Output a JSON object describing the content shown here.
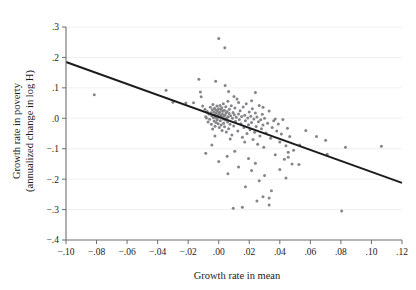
{
  "chart_data": {
    "type": "scatter",
    "title": "",
    "xlabel": "Growth rate in mean",
    "ylabel": "Growth rate in poverty\n(annualized change in log H)",
    "ylabel_line1": "Growth rate in poverty",
    "ylabel_line2": "(annualized change in log H)",
    "xlim": [
      -0.1,
      0.12
    ],
    "ylim": [
      -0.4,
      0.3
    ],
    "xticks": [
      -0.1,
      -0.08,
      -0.06,
      -0.04,
      -0.02,
      0.0,
      0.02,
      0.04,
      0.06,
      0.08,
      0.1,
      0.12
    ],
    "xticklabels": [
      "−.10",
      "−.08",
      "−.06",
      "−.04",
      "−.02",
      ".00",
      ".02",
      ".04",
      ".06",
      ".08",
      ".10",
      ".12"
    ],
    "yticks": [
      0.3,
      0.2,
      0.1,
      0.0,
      -0.1,
      -0.2,
      -0.3,
      -0.4
    ],
    "yticklabels": [
      ".3",
      ".2",
      ".1",
      ".0",
      "−.1",
      "−.2",
      "−.3",
      "−.4"
    ],
    "grid": "horizontal",
    "legend": "none",
    "marker_color": "#858589",
    "line_color": "#1c1c1c",
    "grid_color": "#e8e8ea",
    "axis_color": "#6d6d70",
    "fit_line": {
      "label": "linear fit",
      "x_start": -0.1,
      "y_start": 0.185,
      "x_end": 0.12,
      "y_end": -0.212,
      "slope": -1.805,
      "intercept": 0.0045
    },
    "points": [
      [
        -0.0815,
        0.077
      ],
      [
        -0.0345,
        0.092
      ],
      [
        -0.03,
        0.053
      ],
      [
        -0.0215,
        0.05
      ],
      [
        -0.0165,
        0.051
      ],
      [
        -0.013,
        0.128
      ],
      [
        -0.012,
        0.086
      ],
      [
        -0.0115,
        0.071
      ],
      [
        -0.0105,
        0.04
      ],
      [
        -0.009,
        0.03
      ],
      [
        -0.0085,
        0.005
      ],
      [
        -0.008,
        0.001
      ],
      [
        -0.0075,
        0.022
      ],
      [
        -0.007,
        -0.012
      ],
      [
        -0.0065,
        0.014
      ],
      [
        -0.006,
        -0.003
      ],
      [
        -0.0055,
        0.036
      ],
      [
        -0.005,
        0.018
      ],
      [
        -0.0048,
        -0.02
      ],
      [
        -0.0045,
        0.008
      ],
      [
        -0.0042,
        0.028
      ],
      [
        -0.004,
        -0.035
      ],
      [
        -0.0038,
        0.045
      ],
      [
        -0.0035,
        0.002
      ],
      [
        -0.0032,
        0.021
      ],
      [
        -0.003,
        -0.009
      ],
      [
        -0.0028,
        0.033
      ],
      [
        -0.0026,
        0.012
      ],
      [
        -0.0024,
        -0.026
      ],
      [
        -0.0022,
        0.006
      ],
      [
        -0.002,
        0.027
      ],
      [
        -0.0018,
        -0.014
      ],
      [
        -0.0016,
        0.017
      ],
      [
        -0.0014,
        0.0
      ],
      [
        -0.0012,
        0.04
      ],
      [
        -0.001,
        -0.005
      ],
      [
        -0.0008,
        0.024
      ],
      [
        -0.0006,
        0.01
      ],
      [
        -0.0004,
        -0.018
      ],
      [
        -0.0002,
        0.031
      ],
      [
        0.0,
        0.262
      ],
      [
        0.0,
        0.004
      ],
      [
        0.0002,
        0.015
      ],
      [
        0.0004,
        -0.03
      ],
      [
        0.0006,
        0.02
      ],
      [
        0.0008,
        0.042
      ],
      [
        0.001,
        -0.008
      ],
      [
        0.0012,
        0.009
      ],
      [
        0.0014,
        0.029
      ],
      [
        0.0016,
        -0.022
      ],
      [
        0.0018,
        0.003
      ],
      [
        0.002,
        0.035
      ],
      [
        0.0022,
        -0.04
      ],
      [
        0.0024,
        0.013
      ],
      [
        0.0026,
        0.023
      ],
      [
        0.0028,
        -0.002
      ],
      [
        0.003,
        0.048
      ],
      [
        0.0032,
        -0.016
      ],
      [
        0.0034,
        0.007
      ],
      [
        0.0036,
        0.026
      ],
      [
        0.0038,
        -0.028
      ],
      [
        0.004,
        0.232
      ],
      [
        0.0042,
        0.011
      ],
      [
        0.0044,
        -0.006
      ],
      [
        0.0046,
        0.038
      ],
      [
        0.0048,
        0.018
      ],
      [
        0.005,
        -0.045
      ],
      [
        0.0052,
        0.001
      ],
      [
        0.0055,
        0.022
      ],
      [
        0.0058,
        -0.012
      ],
      [
        0.006,
        0.056
      ],
      [
        0.0062,
        0.005
      ],
      [
        0.0065,
        -0.034
      ],
      [
        0.0068,
        0.016
      ],
      [
        0.007,
        0.03
      ],
      [
        0.0074,
        -0.02
      ],
      [
        0.0078,
        0.008
      ],
      [
        0.0082,
        0.041
      ],
      [
        0.0086,
        -0.055
      ],
      [
        0.009,
        0.0
      ],
      [
        0.0094,
        0.019
      ],
      [
        0.0098,
        -0.025
      ],
      [
        0.0102,
        0.012
      ],
      [
        0.0106,
        0.034
      ],
      [
        0.011,
        -0.01
      ],
      [
        0.0115,
        0.003
      ],
      [
        0.012,
        0.063
      ],
      [
        0.0125,
        -0.042
      ],
      [
        0.013,
        0.014
      ],
      [
        0.0135,
        -0.004
      ],
      [
        0.014,
        0.025
      ],
      [
        0.0145,
        -0.018
      ],
      [
        0.015,
        0.006
      ],
      [
        0.0155,
        -0.062
      ],
      [
        0.016,
        0.037
      ],
      [
        0.0165,
        -0.03
      ],
      [
        0.017,
        0.01
      ],
      [
        0.0175,
        -0.008
      ],
      [
        0.018,
        0.048
      ],
      [
        0.0185,
        -0.05
      ],
      [
        0.019,
        0.001
      ],
      [
        0.0195,
        -0.021
      ],
      [
        0.02,
        0.021
      ],
      [
        0.0205,
        -0.038
      ],
      [
        0.021,
        0.007
      ],
      [
        0.0215,
        -0.014
      ],
      [
        0.022,
        0.031
      ],
      [
        0.0225,
        -0.07
      ],
      [
        0.023,
        -0.002
      ],
      [
        0.0235,
        -0.046
      ],
      [
        0.024,
        0.017
      ],
      [
        0.0245,
        -0.027
      ],
      [
        0.025,
        0.004
      ],
      [
        0.0255,
        -0.085
      ],
      [
        0.026,
        -0.011
      ],
      [
        0.0265,
        0.042
      ],
      [
        0.027,
        -0.058
      ],
      [
        0.0275,
        -0.005
      ],
      [
        0.028,
        -0.034
      ],
      [
        0.0285,
        0.013
      ],
      [
        0.029,
        -0.022
      ],
      [
        0.0295,
        -0.095
      ],
      [
        0.03,
        0.0
      ],
      [
        0.031,
        -0.048
      ],
      [
        0.032,
        -0.016
      ],
      [
        0.033,
        0.024
      ],
      [
        0.034,
        -0.066
      ],
      [
        0.035,
        -0.03
      ],
      [
        0.036,
        -0.008
      ],
      [
        0.037,
        -0.12
      ],
      [
        0.038,
        -0.042
      ],
      [
        0.039,
        -0.019
      ],
      [
        0.04,
        -0.078
      ],
      [
        0.041,
        -0.052
      ],
      [
        0.042,
        -0.004
      ],
      [
        0.043,
        -0.135
      ],
      [
        0.044,
        -0.09
      ],
      [
        0.045,
        -0.033
      ],
      [
        0.0455,
        -0.112
      ],
      [
        0.0465,
        -0.06
      ],
      [
        0.048,
        -0.15
      ],
      [
        0.049,
        -0.105
      ],
      [
        0.0195,
        -0.132
      ],
      [
        0.024,
        -0.148
      ],
      [
        0.0215,
        -0.172
      ],
      [
        0.0265,
        -0.205
      ],
      [
        0.0105,
        -0.108
      ],
      [
        0.0055,
        -0.125
      ],
      [
        0.013,
        -0.16
      ],
      [
        -0.0045,
        -0.088
      ],
      [
        -0.0085,
        -0.115
      ],
      [
        0.0,
        -0.142
      ],
      [
        0.006,
        -0.182
      ],
      [
        0.0175,
        -0.225
      ],
      [
        0.03,
        -0.188
      ],
      [
        0.0345,
        -0.238
      ],
      [
        0.029,
        -0.258
      ],
      [
        0.033,
        -0.262
      ],
      [
        0.033,
        -0.285
      ],
      [
        0.025,
        -0.272
      ],
      [
        0.0155,
        -0.292
      ],
      [
        0.0095,
        -0.296
      ],
      [
        0.0805,
        -0.305
      ],
      [
        0.053,
        -0.088
      ],
      [
        0.057,
        -0.04
      ],
      [
        0.064,
        -0.06
      ],
      [
        0.07,
        -0.072
      ],
      [
        0.071,
        -0.118
      ],
      [
        0.083,
        -0.095
      ],
      [
        0.1065,
        -0.092
      ],
      [
        0.0525,
        -0.152
      ],
      [
        0.0455,
        -0.128
      ],
      [
        0.04,
        -0.168
      ],
      [
        0.044,
        -0.196
      ],
      [
        0.017,
        -0.078
      ],
      [
        0.0075,
        -0.068
      ],
      [
        -0.0025,
        -0.058
      ],
      [
        0.037,
        -0.002
      ],
      [
        0.029,
        0.036
      ],
      [
        0.0215,
        0.058
      ],
      [
        0.013,
        0.052
      ],
      [
        0.0065,
        0.088
      ],
      [
        0.0042,
        0.108
      ],
      [
        -0.002,
        0.122
      ],
      [
        0.024,
        0.085
      ],
      [
        0.01,
        0.072
      ]
    ]
  }
}
